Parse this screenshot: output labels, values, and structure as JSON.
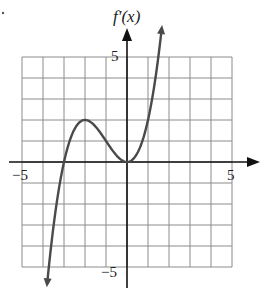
{
  "chart_data": {
    "type": "line",
    "title": "",
    "ylabel": "f'(x)",
    "xlabel": "",
    "xlim": [
      -5,
      5
    ],
    "ylim": [
      -5,
      5
    ],
    "grid": true,
    "grid_step": 1,
    "x_tick_labels": [
      "-5",
      "5"
    ],
    "y_tick_labels": [
      "5",
      "-5"
    ],
    "legend": null,
    "series": [
      {
        "name": "f'(x)",
        "description": "Cubic with a single root at x = -3, a local maximum at about (-2, 2), and a double root (tangent touch) at x = 0; arrows indicate it continues down to the left and up to the right",
        "x": [
          -3.8,
          -3.5,
          -3,
          -2.5,
          -2,
          -1.5,
          -1,
          -0.5,
          0,
          0.5,
          1,
          1.5,
          1.65
        ],
        "values": [
          -5.8,
          -3.1,
          0,
          1.6,
          2,
          1.7,
          1,
          0.3,
          0,
          0.4,
          2,
          5.1,
          6.2
        ],
        "key_points": {
          "roots": [
            -3,
            0
          ],
          "local_max": [
            -2,
            2
          ],
          "local_min": [
            0,
            0
          ]
        }
      }
    ]
  },
  "labels": {
    "function": "f′(x)",
    "x_min": "−5",
    "x_max": "5",
    "y_max": "5",
    "y_min": "−5"
  },
  "colors": {
    "curve": "#4a4a4a",
    "axis": "#111111",
    "grid": "#8c8c8c"
  }
}
